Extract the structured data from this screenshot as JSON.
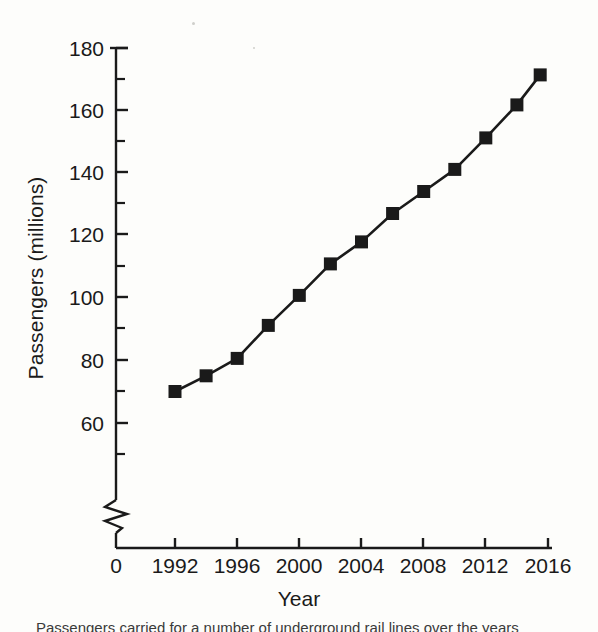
{
  "figure": {
    "background_color": "#fdfdfb",
    "ink_color": "#1a1a1a",
    "caption_partial": "Passengers carried for a number of underground rail lines over the years"
  },
  "axes": {
    "y_label": "Passengers (millions)",
    "x_label": "Year",
    "y_ticks": [
      "180",
      "160",
      "140",
      "120",
      "100",
      "80",
      "60"
    ],
    "y_break_zero_label": "0",
    "x_ticks": [
      "1992",
      "1996",
      "2000",
      "2004",
      "2008",
      "2012",
      "2016"
    ]
  },
  "chart_data": {
    "type": "line",
    "title": "",
    "xlabel": "Year",
    "ylabel": "Passengers (millions)",
    "xlim": [
      1990.5,
      2016.5
    ],
    "ylim": [
      56,
      182
    ],
    "axis_break": true,
    "axis_break_note": "y-axis broken between 0 and ~56",
    "grid": false,
    "legend": "none",
    "marker": "square",
    "x": [
      1992,
      1994,
      1996,
      1998,
      2000,
      2002,
      2004,
      2006,
      2008,
      2010,
      2012,
      2014,
      2015.5
    ],
    "values": [
      70,
      75,
      80.5,
      91,
      100.5,
      110.5,
      117.5,
      126.5,
      133.5,
      140.5,
      150.5,
      161,
      170.5
    ],
    "series": [
      {
        "name": "Passengers",
        "values": [
          70,
          75,
          80.5,
          91,
          100.5,
          110.5,
          117.5,
          126.5,
          133.5,
          140.5,
          150.5,
          161,
          170.5
        ]
      }
    ],
    "y_major_ticks": [
      60,
      80,
      100,
      120,
      140,
      160,
      180
    ],
    "y_minor_ticks": [
      50,
      70,
      90,
      110,
      130,
      150,
      170
    ],
    "x_major_ticks": [
      1992,
      1996,
      2000,
      2004,
      2008,
      2012,
      2016
    ]
  }
}
